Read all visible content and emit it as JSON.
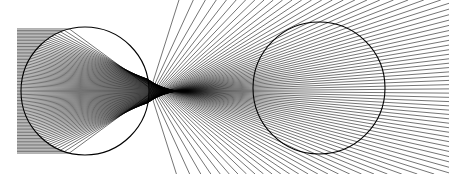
{
  "figure": {
    "background_color": "#ffffff",
    "stroke_color": "#000000",
    "width": 449,
    "height": 174,
    "panel_count": 2
  },
  "chart_data": {
    "type": "scatter",
    "subtitle": "",
    "xlabel": "",
    "ylabel": "",
    "grid": false,
    "legend": null,
    "axis_visible": false,
    "xlim": [
      0,
      449
    ],
    "ylim": [
      0,
      174
    ],
    "background_color": "#ffffff",
    "line_color": "#000000",
    "panels": [
      {
        "name": "left-panel-parallel-rays",
        "label": "Parallel incident rays focused by a refracting sphere",
        "source_type": "parallel-beam",
        "circle": {
          "cx": 85,
          "cy": 91,
          "r": 64
        },
        "refractive_index": 1.52,
        "ray_count": 86,
        "ray_entry_x": 17,
        "ray_exit_x": 449,
        "beam_half_height": 63,
        "stroke_width": 0.55,
        "circle_stroke_width": 1.1,
        "caustic_focus": {
          "x": 150,
          "y": 91
        },
        "aperture_fraction": 0.985
      },
      {
        "name": "right-panel-point-source-rays",
        "label": "Point-source rays forming a bowtie caustic in a sphere",
        "source_type": "point-source",
        "circle": {
          "cx": 319,
          "cy": 88,
          "r": 66
        },
        "refractive_index": 1.52,
        "ray_count": 86,
        "source_point": {
          "x": 253,
          "y": 88
        },
        "ray_exit_x": 449,
        "fan_half_angle_deg": 74,
        "stroke_width": 0.55,
        "circle_stroke_width": 1.1,
        "caustic_focus": {
          "x": 349,
          "y": 88
        }
      }
    ]
  }
}
